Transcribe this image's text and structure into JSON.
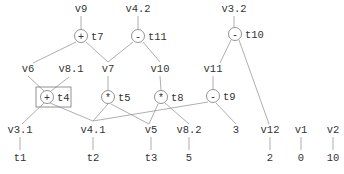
{
  "diagram": {
    "type": "expression-dag",
    "ops": [
      {
        "id": "t7",
        "op": "+",
        "x": 81,
        "y": 36
      },
      {
        "id": "t11",
        "op": "-",
        "x": 138,
        "y": 36
      },
      {
        "id": "t10",
        "op": "-",
        "x": 235,
        "y": 34
      },
      {
        "id": "t4",
        "op": "+",
        "x": 47,
        "y": 97,
        "highlighted": true
      },
      {
        "id": "t5",
        "op": "*",
        "x": 108,
        "y": 97
      },
      {
        "id": "t8",
        "op": "*",
        "x": 161,
        "y": 97
      },
      {
        "id": "t9",
        "op": "-",
        "x": 213,
        "y": 96
      }
    ],
    "vars": [
      {
        "id": "v9",
        "x": 81,
        "y": 12
      },
      {
        "id": "v4.2",
        "x": 138,
        "y": 12
      },
      {
        "id": "v3.2",
        "x": 234,
        "y": 12
      },
      {
        "id": "v6",
        "x": 28,
        "y": 72
      },
      {
        "id": "v8.1",
        "x": 71,
        "y": 72
      },
      {
        "id": "v7",
        "x": 108,
        "y": 72
      },
      {
        "id": "v10",
        "x": 160,
        "y": 72
      },
      {
        "id": "v11",
        "x": 213,
        "y": 72
      },
      {
        "id": "v3.1",
        "x": 20,
        "y": 133
      },
      {
        "id": "v4.1",
        "x": 93,
        "y": 133
      },
      {
        "id": "v5",
        "x": 151,
        "y": 133
      },
      {
        "id": "v8.2",
        "x": 189,
        "y": 133
      },
      {
        "id": "3",
        "x": 236,
        "y": 133
      },
      {
        "id": "v12",
        "x": 270,
        "y": 133
      },
      {
        "id": "v1",
        "x": 301,
        "y": 133
      },
      {
        "id": "v2",
        "x": 333,
        "y": 133
      }
    ],
    "leaves": [
      {
        "id": "t1",
        "x": 20,
        "y": 161
      },
      {
        "id": "t2",
        "x": 93,
        "y": 161
      },
      {
        "id": "t3",
        "x": 151,
        "y": 161
      },
      {
        "id": "5",
        "x": 189,
        "y": 161
      },
      {
        "id": "2",
        "x": 270,
        "y": 161
      },
      {
        "id": "0",
        "x": 301,
        "y": 161
      },
      {
        "id": "10",
        "x": 333,
        "y": 161
      }
    ],
    "edges": [
      [
        81,
        16,
        81,
        29
      ],
      [
        138,
        16,
        138,
        29
      ],
      [
        234,
        16,
        234,
        27
      ],
      [
        76,
        42,
        33,
        63
      ],
      [
        86,
        42,
        108,
        62
      ],
      [
        133,
        42,
        108,
        62
      ],
      [
        143,
        42,
        160,
        62
      ],
      [
        231,
        40,
        220,
        63
      ],
      [
        239,
        40,
        269,
        124
      ],
      [
        28,
        76,
        44,
        91
      ],
      [
        69,
        77,
        51,
        91
      ],
      [
        108,
        76,
        108,
        90
      ],
      [
        160,
        76,
        161,
        90
      ],
      [
        213,
        76,
        213,
        89
      ],
      [
        44,
        103,
        22,
        124
      ],
      [
        50,
        103,
        93,
        121
      ],
      [
        108,
        104,
        93,
        121
      ],
      [
        111,
        104,
        149,
        124
      ],
      [
        158,
        104,
        149,
        124
      ],
      [
        165,
        103,
        189,
        124
      ],
      [
        208,
        102,
        93,
        121
      ],
      [
        216,
        103,
        236,
        124
      ],
      [
        20,
        137,
        20,
        150
      ],
      [
        93,
        137,
        93,
        150
      ],
      [
        151,
        137,
        151,
        150
      ],
      [
        189,
        137,
        189,
        150
      ],
      [
        270,
        137,
        270,
        150
      ],
      [
        301,
        137,
        301,
        150
      ],
      [
        333,
        137,
        333,
        150
      ]
    ]
  }
}
